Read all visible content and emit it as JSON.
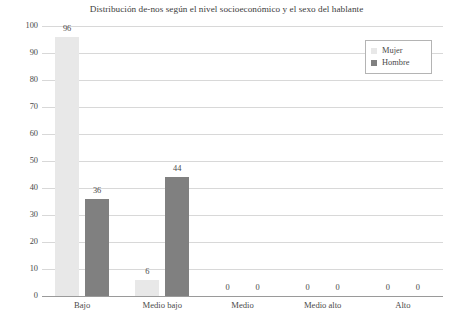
{
  "chart_data": {
    "type": "bar",
    "title": "Distribución de-nos según el nivel socioeconómico y el sexo del hablante",
    "xlabel": "",
    "ylabel": "",
    "categories": [
      "Bajo",
      "Medio bajo",
      "Medio",
      "Medio alto",
      "Alto"
    ],
    "series": [
      {
        "name": "Mujer",
        "color": "#e8e8e8",
        "values": [
          96,
          6,
          0,
          0,
          0
        ]
      },
      {
        "name": "Hombre",
        "color": "#808080",
        "values": [
          36,
          44,
          0,
          0,
          0
        ]
      }
    ],
    "ylim": [
      0,
      100
    ],
    "yticks": [
      100,
      90,
      80,
      70,
      60,
      50,
      40,
      30,
      20,
      10,
      0
    ],
    "ytick_labels": [
      "100",
      "90",
      "80",
      "70",
      "60",
      "50",
      "40",
      "30",
      "20",
      "10",
      "0"
    ],
    "grid": true,
    "legend_position": "top-right",
    "bar_labels": [
      [
        "96",
        "36"
      ],
      [
        "6",
        "44"
      ],
      [
        "0",
        "0"
      ],
      [
        "0",
        "0"
      ],
      [
        "0",
        "0"
      ]
    ]
  },
  "legend": {
    "items": [
      {
        "label": "Mujer",
        "swatch": "mujer-swatch"
      },
      {
        "label": "Hombre",
        "swatch": "hombre-swatch"
      }
    ]
  }
}
